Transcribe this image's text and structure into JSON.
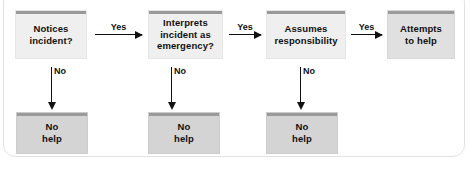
{
  "figure": {
    "frame_color": "#e2e2e2",
    "background": "#ffffff"
  },
  "colors": {
    "decision_fill": "#efefef",
    "outcome_fill": "#d4d4d4",
    "terminal_fill": "#e0e0e0",
    "accent_bar": "#9a9a9a",
    "arrow": "#111111",
    "text": "#111111"
  },
  "nodes": {
    "step1": {
      "label": "Notices\nincident?",
      "type": "decision"
    },
    "step2": {
      "label": "Interprets\nincident as\nemergency?",
      "type": "decision"
    },
    "step3": {
      "label": "Assumes\nresponsibility",
      "type": "decision"
    },
    "step4": {
      "label": "Attempts\nto help",
      "type": "terminal"
    },
    "nohelp1": {
      "label": "No\nhelp",
      "type": "outcome"
    },
    "nohelp2": {
      "label": "No\nhelp",
      "type": "outcome"
    },
    "nohelp3": {
      "label": "No\nhelp",
      "type": "outcome"
    }
  },
  "edges": {
    "yes1": {
      "label": "Yes",
      "from": "step1",
      "to": "step2"
    },
    "yes2": {
      "label": "Yes",
      "from": "step2",
      "to": "step3"
    },
    "yes3": {
      "label": "Yes",
      "from": "step3",
      "to": "step4"
    },
    "no1": {
      "label": "No",
      "from": "step1",
      "to": "nohelp1"
    },
    "no2": {
      "label": "No",
      "from": "step2",
      "to": "nohelp2"
    },
    "no3": {
      "label": "No",
      "from": "step3",
      "to": "nohelp3"
    }
  }
}
